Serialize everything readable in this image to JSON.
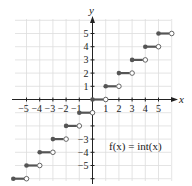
{
  "chart_data": {
    "type": "line",
    "title": "",
    "function_label": "f(x) = int(x)",
    "xlabel": "x",
    "ylabel": "y",
    "xlim": [
      -6,
      6
    ],
    "ylim": [
      -6,
      6
    ],
    "grid": true,
    "x_ticks": [
      -5,
      -4,
      -3,
      -2,
      -1,
      1,
      2,
      3,
      4,
      5
    ],
    "x_tick_labels": [
      "−5",
      "−4",
      "−3",
      "−2",
      "−1",
      "1",
      "2",
      "3",
      "4",
      "5"
    ],
    "y_ticks": [
      5,
      4,
      3,
      2,
      1,
      -3,
      -4,
      -5
    ],
    "y_tick_labels": [
      "5",
      "4",
      "3",
      "2",
      "1",
      "−3",
      "−4",
      "−5"
    ],
    "segments": [
      {
        "x_start": -6,
        "x_end": -5,
        "y": -6,
        "closed_start": true,
        "open_end": true
      },
      {
        "x_start": -5,
        "x_end": -4,
        "y": -5,
        "closed_start": true,
        "open_end": true
      },
      {
        "x_start": -4,
        "x_end": -3,
        "y": -4,
        "closed_start": true,
        "open_end": true
      },
      {
        "x_start": -3,
        "x_end": -2,
        "y": -3,
        "closed_start": true,
        "open_end": true
      },
      {
        "x_start": -2,
        "x_end": -1,
        "y": -2,
        "closed_start": true,
        "open_end": true
      },
      {
        "x_start": -1,
        "x_end": 0,
        "y": -1,
        "closed_start": true,
        "open_end": true
      },
      {
        "x_start": 0,
        "x_end": 1,
        "y": 0,
        "closed_start": true,
        "open_end": true
      },
      {
        "x_start": 1,
        "x_end": 2,
        "y": 1,
        "closed_start": true,
        "open_end": true
      },
      {
        "x_start": 2,
        "x_end": 3,
        "y": 2,
        "closed_start": true,
        "open_end": true
      },
      {
        "x_start": 3,
        "x_end": 4,
        "y": 3,
        "closed_start": true,
        "open_end": true
      },
      {
        "x_start": 4,
        "x_end": 5,
        "y": 4,
        "closed_start": true,
        "open_end": true
      },
      {
        "x_start": 5,
        "x_end": 6,
        "y": 5,
        "closed_start": true,
        "open_end": true
      }
    ],
    "colors": {
      "step": "#555555",
      "grid": "#dddddd",
      "axis": "#222222"
    }
  }
}
